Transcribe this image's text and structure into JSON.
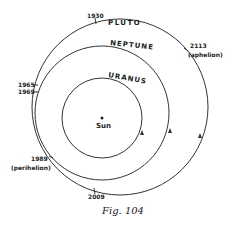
{
  "diagram": {
    "center_label": "Sun",
    "orbits": [
      {
        "name": "URANUS"
      },
      {
        "name": "NEPTUNE"
      },
      {
        "name": "PLUTO"
      }
    ],
    "markers": {
      "y1930": "1930",
      "y1965": "1965",
      "y1969": "1969",
      "y1989": "1989",
      "perihelion": "(perihelion)",
      "y2009": "2009",
      "y2113": "2113",
      "aphelion": "(aphelion)"
    },
    "caption": "Fig. 104"
  }
}
